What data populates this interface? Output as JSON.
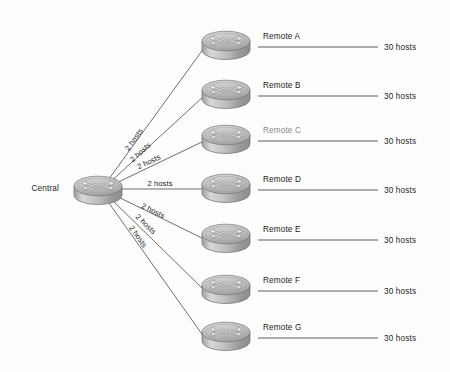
{
  "diagram": {
    "background_color": "#fdfdfd",
    "line_color": "#4a4a4a",
    "text_color": "#1c1c1c",
    "router_body_color": "#b9b9b9",
    "router_top_color": "#cfcfcf",
    "central": {
      "label": "Central",
      "icon": "router-icon",
      "x": 98,
      "y": 188
    },
    "remotes": [
      {
        "label": "Remote A",
        "icon": "router-icon",
        "x": 226,
        "y": 43,
        "link_label": "2 hosts",
        "hosts_label": "30 hosts"
      },
      {
        "label": "Remote B",
        "icon": "router-icon",
        "x": 226,
        "y": 92,
        "link_label": "2 hosts",
        "hosts_label": "30 hosts"
      },
      {
        "label": "Remote C",
        "icon": "router-icon",
        "x": 226,
        "y": 137,
        "link_label": "2 hosts",
        "hosts_label": "30 hosts"
      },
      {
        "label": "Remote D",
        "icon": "router-icon",
        "x": 226,
        "y": 186,
        "link_label": "2 hosts",
        "hosts_label": "30 hosts"
      },
      {
        "label": "Remote E",
        "icon": "router-icon",
        "x": 226,
        "y": 236,
        "link_label": "2 hosts",
        "hosts_label": "30 hosts"
      },
      {
        "label": "Remote F",
        "icon": "router-icon",
        "x": 226,
        "y": 287,
        "link_label": "2 hosts",
        "hosts_label": "30 hosts"
      },
      {
        "label": "Remote G",
        "icon": "router-icon",
        "x": 226,
        "y": 334,
        "link_label": "2 hosts",
        "hosts_label": "30 hosts"
      }
    ],
    "link_label_positions": [
      {
        "x": 136,
        "y": 141,
        "angle": -32.0
      },
      {
        "x": 141,
        "y": 152,
        "angle": -24.5
      },
      {
        "x": 147,
        "y": 161,
        "angle": -15.0
      },
      {
        "x": 158,
        "y": 183,
        "angle": 0
      },
      {
        "x": 152,
        "y": 213,
        "angle": 14.5
      },
      {
        "x": 144,
        "y": 224,
        "angle": 26.0
      },
      {
        "x": 138,
        "y": 236,
        "angle": 34.5
      }
    ],
    "host_line": {
      "start_x": 258,
      "end_x": 378,
      "label_x": 384
    }
  }
}
